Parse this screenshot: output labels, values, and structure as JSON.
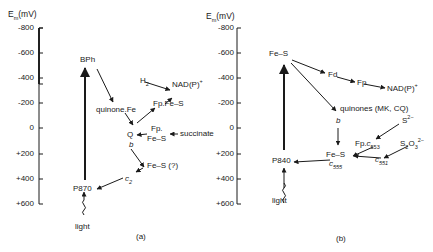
{
  "axis": {
    "title": "E",
    "title_sub": "m",
    "title_unit": "(mV)",
    "ticks": [
      "-800",
      "-600",
      "-400",
      "-200",
      "0",
      "+200",
      "+400",
      "+600"
    ]
  },
  "panel_a": {
    "caption": "(a)",
    "nodes": {
      "bph": "BPh",
      "quinone_fe": "quinone.Fe",
      "h2": "H",
      "h2_sub": "2",
      "nadp": "NAD(P)",
      "nadp_sup": "+",
      "fp_fes": "Fp.Fe–S",
      "q": "Q",
      "b": "b",
      "fp": "Fp.",
      "fes": "Fe–S",
      "succinate": "succinate",
      "fes_q": "Fe–S (?)",
      "c2": "c",
      "c2_sub": "2",
      "p870": "P870",
      "light": "light"
    }
  },
  "panel_b": {
    "caption": "(b)",
    "nodes": {
      "fes_top": "Fe–S",
      "fd": "Fd",
      "fp": "Fp",
      "nadp": "NAD(P)",
      "nadp_sup": "+",
      "quinones": "quinones (MK, CQ)",
      "b": "b",
      "s2": "S",
      "s2_sup": "2−",
      "fp_c553": "Fp.",
      "c553": "c",
      "c553_sub": "553",
      "s2o3": "S",
      "s2o3_sub1": "2",
      "s2o3_mid": "O",
      "s2o3_sub2": "3",
      "s2o3_sup": "2−",
      "fes_mid": "Fe–S",
      "c555": "c",
      "c555_sub": "555",
      "c551": "c",
      "c551_sub": "551",
      "p840": "P840",
      "light": "light"
    }
  }
}
